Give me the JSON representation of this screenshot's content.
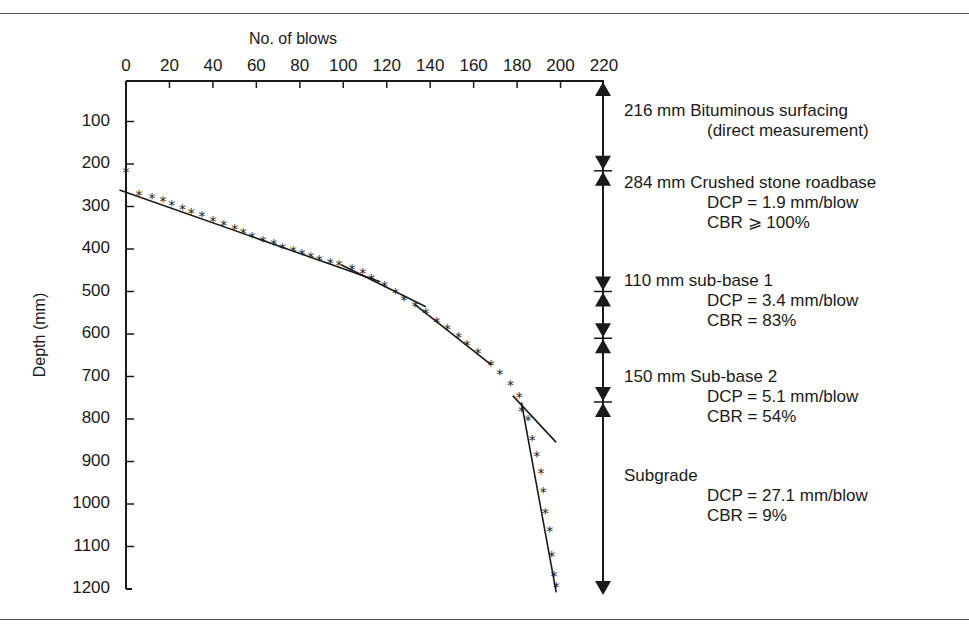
{
  "chart_data": {
    "type": "scatter",
    "title": "",
    "xlabel": "No. of blows",
    "ylabel": "Depth (mm)",
    "xlim": [
      0,
      220
    ],
    "ylim": [
      0,
      1200
    ],
    "y_inverted": true,
    "x_axis_position": "top",
    "x_ticks": [
      0,
      20,
      40,
      60,
      80,
      100,
      120,
      140,
      160,
      180,
      200,
      220
    ],
    "y_ticks": [
      100,
      200,
      300,
      400,
      500,
      600,
      700,
      800,
      900,
      1000,
      1100,
      1200
    ],
    "grid": false,
    "series": [
      {
        "name": "DCP readings",
        "marker": "*",
        "points": [
          [
            0,
            216
          ],
          [
            6,
            270
          ],
          [
            12,
            277
          ],
          [
            17,
            284
          ],
          [
            21,
            294
          ],
          [
            26,
            303
          ],
          [
            30,
            312
          ],
          [
            35,
            320
          ],
          [
            40,
            331
          ],
          [
            45,
            341
          ],
          [
            50,
            350
          ],
          [
            54,
            360
          ],
          [
            58,
            369
          ],
          [
            63,
            378
          ],
          [
            68,
            385
          ],
          [
            72,
            395
          ],
          [
            77,
            402
          ],
          [
            81,
            409
          ],
          [
            85,
            416
          ],
          [
            89,
            423
          ],
          [
            94,
            430
          ],
          [
            98,
            435
          ],
          [
            104,
            444
          ],
          [
            109,
            454
          ],
          [
            113,
            468
          ],
          [
            119,
            484
          ],
          [
            124,
            500
          ],
          [
            128,
            517
          ],
          [
            133,
            531
          ],
          [
            138,
            548
          ],
          [
            143,
            569
          ],
          [
            148,
            585
          ],
          [
            153,
            604
          ],
          [
            157,
            623
          ],
          [
            162,
            642
          ],
          [
            168,
            670
          ],
          [
            172,
            691
          ],
          [
            177,
            717
          ],
          [
            181,
            745
          ],
          [
            182,
            778
          ],
          [
            185,
            801
          ],
          [
            187,
            848
          ],
          [
            189,
            884
          ],
          [
            191,
            924
          ],
          [
            192,
            970
          ],
          [
            193,
            1018
          ],
          [
            195,
            1060
          ],
          [
            196,
            1119
          ],
          [
            197,
            1166
          ],
          [
            198,
            1192
          ]
        ]
      }
    ],
    "fit_lines": [
      {
        "name": "Crushed stone roadbase",
        "from": [
          -3,
          261
        ],
        "to": [
          117,
          477
        ]
      },
      {
        "name": "sub-base 1",
        "from": [
          99,
          437
        ],
        "to": [
          138,
          536
        ]
      },
      {
        "name": "Sub-base 2 (upper)",
        "from": [
          133,
          531
        ],
        "to": [
          168,
          672
        ]
      },
      {
        "name": "Sub-base 2 (lower)",
        "from": [
          178,
          745
        ],
        "to": [
          198,
          855
        ]
      },
      {
        "name": "Subgrade",
        "from": [
          182,
          761
        ],
        "to": [
          198,
          1208
        ]
      }
    ],
    "layer_boundaries_mm": [
      216,
      500,
      610,
      760
    ],
    "annotations": [
      {
        "layer": "216 mm Bituminous surfacing",
        "lines": [
          "(direct measurement)"
        ]
      },
      {
        "layer": "284 mm Crushed stone roadbase",
        "lines": [
          "DCP = 1.9 mm/blow",
          "CBR ⩾ 100%"
        ]
      },
      {
        "layer": "110 mm sub-base 1",
        "lines": [
          "DCP = 3.4 mm/blow",
          "CBR = 83%"
        ]
      },
      {
        "layer": "150 mm Sub-base 2",
        "lines": [
          "DCP = 5.1 mm/blow",
          "CBR = 54%"
        ]
      },
      {
        "layer": "Subgrade",
        "lines": [
          "DCP = 27.1 mm/blow",
          "CBR = 9%"
        ]
      }
    ]
  },
  "labels": {
    "xlabel": "No. of blows",
    "ylabel": "Depth (mm)",
    "xticks": [
      "0",
      "20",
      "40",
      "60",
      "80",
      "100",
      "120",
      "140",
      "160",
      "180",
      "200",
      "220"
    ],
    "yticks": [
      "100",
      "200",
      "300",
      "400",
      "500",
      "600",
      "700",
      "800",
      "900",
      "1000",
      "1100",
      "1200"
    ]
  },
  "annotations": [
    {
      "head": "216 mm Bituminous surfacing",
      "l1": "(direct measurement)",
      "l2": ""
    },
    {
      "head": "284 mm Crushed stone roadbase",
      "l1": "DCP = 1.9 mm/blow",
      "l2": "CBR ⩾ 100%"
    },
    {
      "head": "110 mm sub-base 1",
      "l1": "DCP = 3.4 mm/blow",
      "l2": "CBR = 83%"
    },
    {
      "head": "150 mm Sub-base 2",
      "l1": "DCP = 5.1 mm/blow",
      "l2": "CBR = 54%"
    },
    {
      "head": "Subgrade",
      "l1": "DCP = 27.1 mm/blow",
      "l2": "CBR = 9%"
    }
  ],
  "colors": {
    "ink": "#1a1a1a",
    "rule": "#555555",
    "background": "#ffffff"
  }
}
